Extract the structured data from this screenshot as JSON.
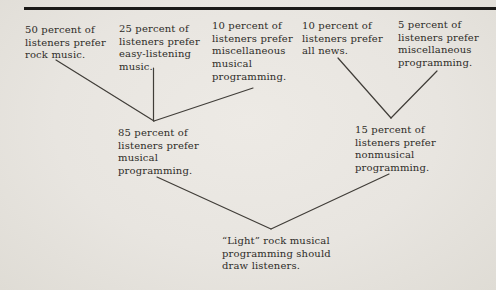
{
  "colors": {
    "bg-center": "#edeae5",
    "bg-mid": "#e8e5e0",
    "bg-edge": "#dfdcd5",
    "rule": "#1b1a18",
    "text": "#2e2c28",
    "connector": "#403d38"
  },
  "diagram": {
    "top_row": [
      {
        "label": "50 percent of\nlisteners prefer\nrock music."
      },
      {
        "label": "25 percent of\nlisteners prefer\neasy-listening\nmusic."
      },
      {
        "label": "10 percent of\nlisteners prefer\nmiscellaneous\nmusical\nprogramming."
      },
      {
        "label": "10 percent of\nlisteners prefer\nall news."
      },
      {
        "label": "5 percent of\nlisteners prefer\nmiscellaneous\nprogramming."
      }
    ],
    "mid_row": [
      {
        "label": "85 percent of\nlisteners prefer\nmusical\nprogramming."
      },
      {
        "label": "15 percent of\nlisteners prefer\nnonmusical\nprogramming."
      }
    ],
    "conclusion": {
      "label": "“Light” rock musical\nprogramming should\ndraw listeners."
    },
    "edges": [
      {
        "from": "rock-music",
        "to": "musical-programming"
      },
      {
        "from": "easy-listening",
        "to": "musical-programming"
      },
      {
        "from": "misc-musical",
        "to": "musical-programming"
      },
      {
        "from": "all-news",
        "to": "nonmusical-programming"
      },
      {
        "from": "misc-programming",
        "to": "nonmusical-programming"
      },
      {
        "from": "musical-programming",
        "to": "conclusion"
      },
      {
        "from": "nonmusical-programming",
        "to": "conclusion"
      }
    ]
  }
}
